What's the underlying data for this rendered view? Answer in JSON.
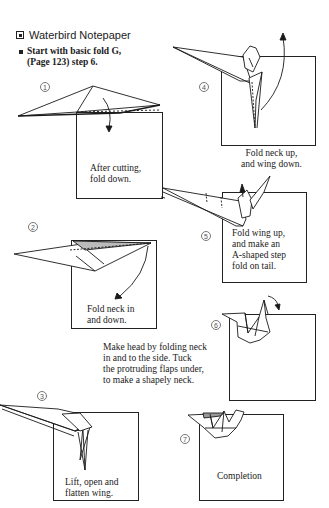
{
  "page": {
    "title": "Waterbird Notepaper",
    "title_icon": "boxed-square-icon",
    "intro_line1": "Start with basic fold G,",
    "intro_line2": "(Page 123) step 6."
  },
  "steps": [
    {
      "number": "1",
      "caption_lines": [
        "After cutting,",
        "fold down."
      ]
    },
    {
      "number": "2",
      "caption_lines": [
        "Fold neck in",
        "and down."
      ]
    },
    {
      "number": "3",
      "caption_lines": [
        "Lift, open and",
        "flatten wing."
      ]
    },
    {
      "number": "4",
      "caption_lines": [
        "Fold neck up,",
        "and wing down."
      ]
    },
    {
      "number": "5",
      "caption_lines": [
        "Fold wing up,",
        "and make an",
        "A-shaped step",
        "fold on tail."
      ]
    },
    {
      "number": "6",
      "caption_lines": [
        "Make head by folding neck",
        "in and to the side. Tuck",
        "the protruding flaps under,",
        "to make a shapely neck."
      ]
    },
    {
      "number": "7",
      "caption_lines": [
        "Completion"
      ]
    }
  ],
  "colors": {
    "ink": "#1a1a1a",
    "paper": "#ffffff",
    "shade": "#9a9a9a"
  }
}
